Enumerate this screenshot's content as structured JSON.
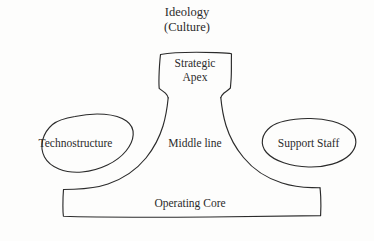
{
  "diagram": {
    "type": "organizational-configuration",
    "medium": "scanned hand-drawn line diagram",
    "stroke_color": "#2b2b2b",
    "background_color": "#fdfdfc",
    "ideology": {
      "line1": "Ideology",
      "line2": "(Culture)"
    },
    "parts": [
      {
        "id": "strategic-apex",
        "label": "Strategic\nApex",
        "label_line1": "Strategic",
        "label_line2": "Apex",
        "shape": "box"
      },
      {
        "id": "middle-line",
        "label": "Middle line",
        "shape": "flared-column"
      },
      {
        "id": "technostructure",
        "label": "Technostructure",
        "shape": "ellipse"
      },
      {
        "id": "support-staff",
        "label": "Support Staff",
        "shape": "ellipse"
      },
      {
        "id": "operating-core",
        "label": "Operating Core",
        "shape": "rectangle"
      }
    ]
  }
}
